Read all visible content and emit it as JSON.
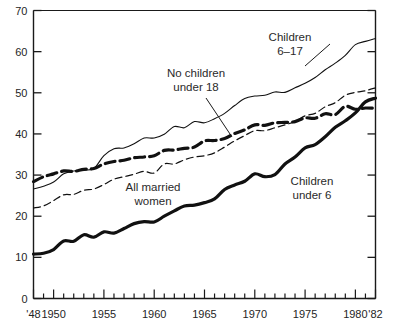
{
  "chart_data": {
    "type": "line",
    "title": "",
    "subtitle": "",
    "xlabel": "",
    "ylabel": "",
    "xlim": [
      1948,
      1982
    ],
    "ylim": [
      0,
      70
    ],
    "grid": false,
    "legend_position": "inline-annotations",
    "ytick_labels": [
      "0",
      "10",
      "20",
      "30",
      "40",
      "50",
      "60",
      "70"
    ],
    "ytick_values": [
      0,
      10,
      20,
      30,
      40,
      50,
      60,
      70
    ],
    "xtick_labels": [
      "'48",
      "1950",
      "1955",
      "1960",
      "1965",
      "1970",
      "1975",
      "1980",
      "'82"
    ],
    "xtick_values": [
      1948,
      1950,
      1955,
      1960,
      1965,
      1970,
      1975,
      1980,
      1982
    ],
    "xtick_minor_step": 1,
    "x": [
      1948,
      1949,
      1950,
      1951,
      1952,
      1953,
      1954,
      1955,
      1956,
      1957,
      1958,
      1959,
      1960,
      1961,
      1962,
      1963,
      1964,
      1965,
      1966,
      1967,
      1968,
      1969,
      1970,
      1971,
      1972,
      1973,
      1974,
      1975,
      1976,
      1977,
      1978,
      1979,
      1980,
      1981,
      1982
    ],
    "series": [
      {
        "name": "Children 6-17",
        "style": "thin-solid",
        "color": "#111111",
        "values": [
          26.6,
          27.3,
          28.3,
          30.3,
          31.0,
          31.2,
          31.6,
          34.7,
          36.4,
          36.6,
          37.6,
          39.0,
          39.0,
          39.9,
          41.8,
          41.5,
          43.0,
          42.7,
          43.7,
          45.0,
          46.9,
          48.6,
          49.2,
          49.4,
          50.2,
          50.1,
          51.2,
          52.3,
          53.7,
          55.6,
          57.2,
          59.1,
          61.7,
          62.5,
          63.2
        ]
      },
      {
        "name": "No children under 18",
        "style": "thick-dashed",
        "color": "#111111",
        "values": [
          28.4,
          29.6,
          30.3,
          31.0,
          30.9,
          31.4,
          31.6,
          32.7,
          33.3,
          33.6,
          34.2,
          34.4,
          34.7,
          36.0,
          36.1,
          36.5,
          36.8,
          38.3,
          38.4,
          38.9,
          40.1,
          41.0,
          42.2,
          42.1,
          42.7,
          42.8,
          43.0,
          43.9,
          43.8,
          44.9,
          44.7,
          46.7,
          46.0,
          46.3,
          46.2
        ]
      },
      {
        "name": "All married women",
        "style": "thin-dashed",
        "color": "#111111",
        "values": [
          22.0,
          22.5,
          23.8,
          25.2,
          25.3,
          26.3,
          26.6,
          27.7,
          29.0,
          29.6,
          30.2,
          30.9,
          30.5,
          32.7,
          32.7,
          33.7,
          34.4,
          34.7,
          35.4,
          36.8,
          38.3,
          39.6,
          40.8,
          40.8,
          41.5,
          42.2,
          43.0,
          44.4,
          45.0,
          46.6,
          47.6,
          49.4,
          50.1,
          50.5,
          51.2
        ]
      },
      {
        "name": "Children under 6",
        "style": "thick-solid",
        "color": "#111111",
        "values": [
          10.8,
          11.0,
          11.9,
          14.0,
          13.9,
          15.5,
          14.9,
          16.2,
          15.9,
          17.0,
          18.2,
          18.7,
          18.6,
          20.0,
          21.3,
          22.5,
          22.7,
          23.3,
          24.2,
          26.5,
          27.6,
          28.5,
          30.3,
          29.6,
          30.1,
          32.7,
          34.4,
          36.6,
          37.4,
          39.3,
          41.6,
          43.2,
          45.1,
          47.8,
          48.7
        ]
      }
    ],
    "annotations": [
      {
        "id": "children-6-17",
        "text_line1": "Children",
        "text_line2": "6–17"
      },
      {
        "id": "no-children-under-18",
        "text_line1": "No children",
        "text_line2": "under 18"
      },
      {
        "id": "all-married-women",
        "text_line1": "All married",
        "text_line2": "women"
      },
      {
        "id": "children-under-6",
        "text_line1": "Children",
        "text_line2": "under 6"
      }
    ]
  },
  "colors": {
    "axis": "#1a1a1a",
    "line": "#111111",
    "text": "#2a2a2a",
    "background": "#ffffff"
  }
}
